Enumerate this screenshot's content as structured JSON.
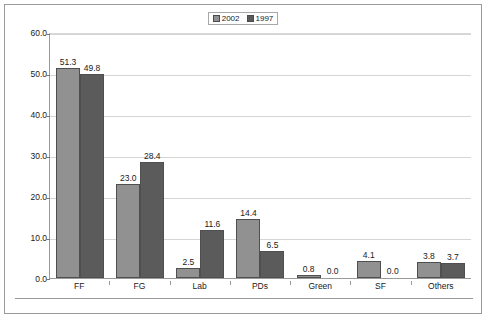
{
  "legend": {
    "entries": [
      {
        "label": "2002",
        "color": "#919191"
      },
      {
        "label": "1997",
        "color": "#5b5b5b"
      }
    ]
  },
  "axis": {
    "y_ticks": [
      "60.0",
      "50.0",
      "40.0",
      "30.0",
      "20.0",
      "10.0",
      "0.0"
    ]
  },
  "chart_data": {
    "type": "bar",
    "title": "",
    "subtitle": "",
    "xlabel": "",
    "ylabel": "",
    "ylim": [
      0,
      60
    ],
    "ytick_step": 10,
    "ytick_labels": [
      "0.0",
      "10.0",
      "20.0",
      "30.0",
      "40.0",
      "50.0",
      "60.0"
    ],
    "grid": true,
    "legend_position": "top-center",
    "categories": [
      "FF",
      "FG",
      "Lab",
      "PDs",
      "Green",
      "SF",
      "Others"
    ],
    "series": [
      {
        "name": "2002",
        "color": "#919191",
        "values": [
          51.3,
          23.0,
          2.5,
          14.4,
          0.8,
          4.1,
          3.8
        ],
        "labels": [
          "51.3",
          "23.0",
          "2.5",
          "14.4",
          "0.8",
          "4.1",
          "3.8"
        ]
      },
      {
        "name": "1997",
        "color": "#5b5b5b",
        "values": [
          49.8,
          28.4,
          11.6,
          6.5,
          0.0,
          0.0,
          3.7
        ],
        "labels": [
          "49.8",
          "28.4",
          "11.6",
          "6.5",
          "0.0",
          "0.0",
          "3.7"
        ]
      }
    ]
  }
}
